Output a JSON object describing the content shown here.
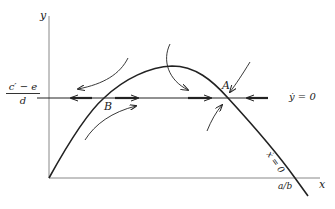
{
  "diagram": {
    "type": "phase-plane",
    "axes": {
      "x_label": "x",
      "y_label": "y"
    },
    "y_intercept_label": {
      "numerator": "c′ − e",
      "denominator": "d"
    },
    "x_intercept_label": "a/b",
    "isoclines": [
      {
        "id": "y-dot-zero",
        "label": "ẏ = 0",
        "shape": "horizontal line"
      },
      {
        "id": "x-dot-zero",
        "label": "ẋ = 0",
        "shape": "hump curve"
      }
    ],
    "equilibria": [
      {
        "label": "A",
        "stability": "stable (arrows converge)"
      },
      {
        "label": "B",
        "stability": "saddle (arrows diverge along line)"
      }
    ],
    "colors": {
      "line": "#222222",
      "background": "#ffffff"
    }
  }
}
